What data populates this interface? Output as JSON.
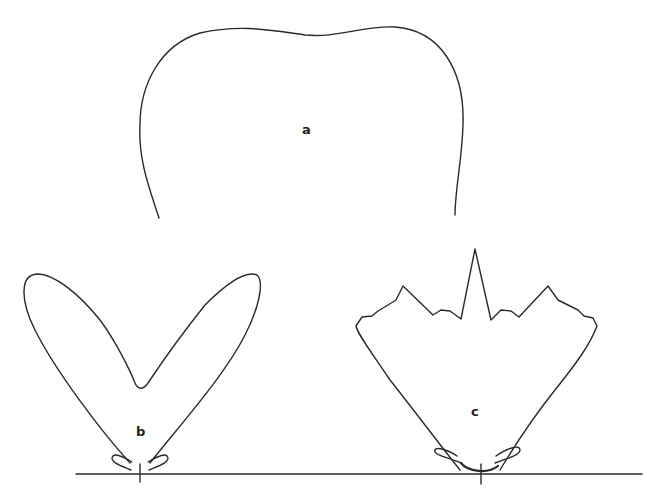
{
  "figure": {
    "type": "radiation-pattern-diagrams",
    "panels": [
      {
        "id": "a",
        "label": "a",
        "description": "broad flat-topped pattern"
      },
      {
        "id": "b",
        "label": "b",
        "description": "two-lobed V-shaped pattern with small side lobes"
      },
      {
        "id": "c",
        "label": "c",
        "description": "fan-shaped pattern with central spike and small side lobes"
      }
    ]
  },
  "colors": {
    "line": "#2a2a2a",
    "background": "#ffffff"
  }
}
